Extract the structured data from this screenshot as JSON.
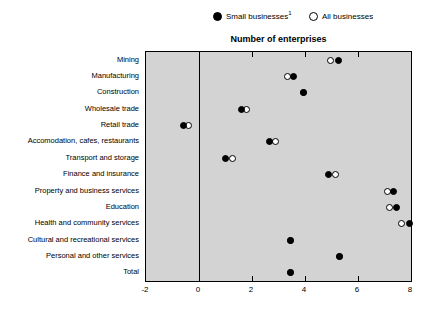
{
  "legend": {
    "small": {
      "label": "Small businesses",
      "footnote": "1",
      "marker": "filled-circle"
    },
    "all": {
      "label": "All businesses",
      "marker": "open-circle"
    }
  },
  "chart_data": {
    "type": "scatter",
    "title": "Number of enterprises",
    "xlabel": "",
    "ylabel": "",
    "xlim": [
      -2,
      8
    ],
    "xticks": [
      -2,
      0,
      2,
      4,
      6,
      8
    ],
    "xtick_labels": [
      "-2",
      "0",
      "2",
      "4",
      "6",
      "8"
    ],
    "grid": false,
    "zero_line": 0,
    "orientation": "horizontal",
    "legend_position": "top",
    "plot_background": "#d3d3d3",
    "categories": [
      "Mining",
      "Manufacturing",
      "Construction",
      "Wholesale trade",
      "Retail trade",
      "Accomodation, cafes, restaurants",
      "Transport and storage",
      "Finance and insurance",
      "Property and business services",
      "Education",
      "Health and community services",
      "Cultural and recreational services",
      "Personal and other services",
      "Total"
    ],
    "series": [
      {
        "name": "Small businesses",
        "marker": "filled-circle",
        "color": "#000000",
        "values": [
          5.25,
          3.55,
          3.95,
          1.6,
          -0.6,
          2.65,
          1.0,
          4.9,
          7.35,
          7.45,
          7.95,
          3.45,
          5.3,
          3.45
        ]
      },
      {
        "name": "All businesses",
        "marker": "open-circle",
        "color": "#ffffff",
        "values": [
          4.95,
          3.35,
          3.95,
          1.8,
          -0.4,
          2.9,
          1.25,
          5.15,
          7.1,
          7.2,
          7.65,
          3.45,
          5.3,
          3.45
        ]
      }
    ]
  }
}
